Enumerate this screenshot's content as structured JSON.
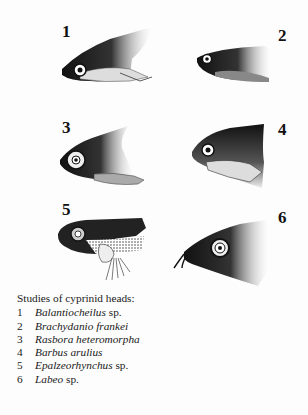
{
  "figures": [
    {
      "number": "1",
      "species": "Balantiocheilus",
      "suffix": " sp."
    },
    {
      "number": "2",
      "species": "Brachydanio frankei",
      "suffix": ""
    },
    {
      "number": "3",
      "species": "Rasbora heteromorpha",
      "suffix": ""
    },
    {
      "number": "4",
      "species": "Barbus arulius",
      "suffix": ""
    },
    {
      "number": "5",
      "species": "Epalzeorhynchus",
      "suffix": " sp."
    },
    {
      "number": "6",
      "species": "Labeo",
      "suffix": " sp."
    }
  ],
  "caption": {
    "title": "Studies of cyprinid heads:"
  },
  "colors": {
    "ink": "#111111",
    "paper": "#fdfdfd"
  }
}
